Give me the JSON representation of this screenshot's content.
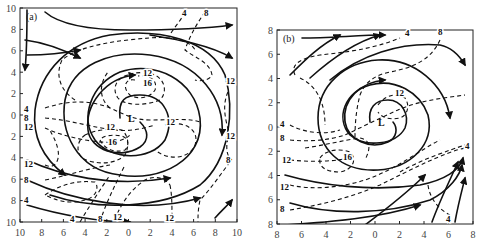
{
  "figure": {
    "panels": [
      {
        "id": "a",
        "label": "(a)",
        "frame": {
          "x": 20,
          "y": 8,
          "w": 217,
          "h": 214
        },
        "x_ticks": [
          "10",
          "8",
          "6",
          "4",
          "2",
          "0",
          "2",
          "4",
          "6",
          "8",
          "10"
        ],
        "y_ticks": [
          "10",
          "8",
          "6",
          "4",
          "2",
          "0",
          "2",
          "4",
          "6",
          "8",
          "10"
        ],
        "center_label": "L",
        "center": {
          "x": 125,
          "y": 118
        },
        "streamlines": [
          "M120,118 C118,100 125,95 140,95 C165,95 175,118 165,140 C150,162 110,160 95,140 C80,118 90,85 120,72 C155,60 195,80 200,118 C205,160 160,182 120,175 C75,170 60,130 65,100 C72,65 110,50 150,55 C200,62 225,100 222,135",
          "M140,122 C148,130 150,140 140,147 C120,160 90,150 88,130 C85,105 105,78 135,75",
          "M50,195 C95,210 160,210 200,185 C230,160 235,110 225,75 C210,40 160,28 110,35 C70,42 40,70 35,110 C32,140 45,160 65,175",
          "M27,180 C70,200 140,215 200,198",
          "M27,205 C60,215 100,222 130,222",
          "M27,160 C60,175 110,188 170,178",
          "M45,12 C60,25 90,30 130,30 C170,30 210,28 232,25",
          "M27,55 C50,55 70,52 80,50",
          "M27,10 C27,30 27,50 25,70",
          "M25,40 C40,42 60,48 80,58",
          "M150,35 C180,40 210,45 232,58",
          "M215,218 C222,210 228,205 232,200"
        ],
        "isotachs": [
          {
            "path": "M45,108 C70,100 90,100 110,108 C125,115 135,120 150,120 C170,120 190,118 200,122",
            "label": "4",
            "lx": 24,
            "ly": 112
          },
          {
            "path": "M45,118 C70,120 95,128 115,130 C130,132 145,128 155,125",
            "label": "8",
            "lx": 24,
            "ly": 121
          },
          {
            "path": "M45,128 C60,135 80,140 100,142 C115,143 125,140 130,135",
            "label": "12",
            "lx": 24,
            "ly": 130
          },
          {
            "path": "M135,80 C125,78 122,88 130,95 C138,100 150,98 155,90 C158,80 150,75 138,76",
            "label": "16",
            "lx": 143,
            "ly": 86
          },
          {
            "path": "M128,75 C115,78 112,90 118,98 C125,106 145,106 160,100 C168,92 165,78 152,74 C145,72 135,72 128,75",
            "label": "12",
            "lx": 143,
            "ly": 76
          },
          {
            "path": "M100,140 C105,150 115,153 125,150 C130,145 128,138 122,136 C112,134 102,136 100,140",
            "label": "16",
            "lx": 108,
            "ly": 145
          },
          {
            "path": "M85,135 C95,130 110,128 122,130 C128,135 130,145 125,155 C115,165 95,165 82,158 C75,150 78,140 85,135",
            "label": "12",
            "lx": 106,
            "ly": 130
          },
          {
            "path": "M165,125 C185,120 200,130 195,145 C190,158 170,162 155,150",
            "label": "12",
            "lx": 166,
            "ly": 125
          },
          {
            "path": "M228,92 C222,105 225,120 230,135",
            "label": "12",
            "lx": 226,
            "ly": 84
          },
          {
            "path": "M228,138 C225,150 228,158 232,160",
            "label": "12",
            "lx": 226,
            "ly": 139
          },
          {
            "path": "M185,12 C180,22 172,30 170,35",
            "label": "4",
            "lx": 182,
            "ly": 16
          },
          {
            "path": "M205,12 C198,22 190,35 185,50 C195,58 210,62 212,75 C210,80 200,82 195,80",
            "label": "8",
            "lx": 204,
            "ly": 16
          },
          {
            "path": "M230,162 C220,175 210,190 200,200 C198,210 198,215 198,222",
            "label": "8",
            "lx": 226,
            "ly": 163
          },
          {
            "path": "M170,185 C172,195 172,205 172,220",
            "label": "12",
            "lx": 165,
            "ly": 221
          },
          {
            "path": "M115,220 C120,205 130,190 145,180 C155,175 165,178 170,185",
            "label": "12",
            "lx": 113,
            "ly": 220
          },
          {
            "path": "M100,222 C105,205 115,185 125,165",
            "label": "8",
            "lx": 98,
            "ly": 222
          },
          {
            "path": "M80,222 C90,205 100,190 110,175",
            "label": "4",
            "lx": 70,
            "ly": 222
          },
          {
            "path": "M45,195 C60,185 75,180 95,182 C100,188 95,198 85,200 C70,205 55,200 45,195",
            "label": "4",
            "lx": 24,
            "ly": 203
          },
          {
            "path": "M45,180 C70,175 90,168 110,165",
            "label": "8",
            "lx": 24,
            "ly": 183
          },
          {
            "path": "M45,165 C55,170 60,160 58,150 C56,140 52,135 50,130",
            "label": "12",
            "lx": 24,
            "ly": 167
          },
          {
            "path": "M75,100 C60,90 55,75 62,60 C80,45 120,40 150,38 C170,36 190,40 195,50",
            "label": "",
            "lx": 0,
            "ly": 0
          },
          {
            "path": "M110,108 C100,100 98,85 108,72",
            "label": "",
            "lx": 0,
            "ly": 0
          }
        ]
      },
      {
        "id": "b",
        "label": "(b)",
        "frame": {
          "x": 277,
          "y": 30,
          "w": 196,
          "h": 194
        },
        "x_ticks": [
          "8",
          "6",
          "4",
          "2",
          "0",
          "2",
          "4",
          "6",
          "8"
        ],
        "y_ticks": [
          "8",
          "6",
          "4",
          "2",
          "0",
          "2",
          "4",
          "6",
          "8"
        ],
        "center_label": "L",
        "center": {
          "x": 375,
          "y": 122
        },
        "streamlines": [
          "M370,122 C368,108 375,100 388,100 C402,100 410,115 405,128 C396,145 365,148 350,135 C335,118 345,92 370,85 C395,78 420,92 428,115 C435,145 410,168 378,170 C340,172 318,148 318,118 C318,85 345,62 378,60 C415,58 445,85 450,118",
          "M393,122 C398,128 397,138 388,142 C370,150 348,140 345,122 C342,100 360,82 385,80",
          "M285,175 C320,185 370,192 420,185 C445,180 460,170 463,158",
          "M290,203 C330,215 385,215 430,200 C450,190 460,175 462,165",
          "M285,225 C330,222 380,218 420,205",
          "M302,38 C330,38 360,35 385,35",
          "M290,75 C305,60 320,45 340,35",
          "M310,78 C330,60 355,42 380,35",
          "M365,225 C385,210 405,195 425,175",
          "M432,222 C440,200 450,180 458,162",
          "M455,222 C458,205 462,190 465,178",
          "M330,80 C360,55 400,42 440,45 C455,48 462,60 465,65"
        ],
        "isotachs": [
          {
            "path": "M378,105 C385,95 398,92 405,98 C410,105 408,115 400,118 C390,120 382,118 378,112",
            "label": "12",
            "lx": 395,
            "ly": 96
          },
          {
            "path": "M320,158 C325,150 340,148 350,152 C358,160 352,170 340,172 C328,172 318,168 320,158",
            "label": "16",
            "lx": 343,
            "ly": 160
          },
          {
            "path": "M305,148 C325,145 345,140 360,138 C372,140 370,150 365,160",
            "label": "",
            "lx": 0,
            "ly": 0
          },
          {
            "path": "M290,160 C310,162 330,162 350,158",
            "label": "12",
            "lx": 282,
            "ly": 163
          },
          {
            "path": "M290,185 C310,190 340,188 365,180 C395,170 420,150 440,140",
            "label": "12",
            "lx": 280,
            "ly": 190
          },
          {
            "path": "M290,210 C320,205 350,198 380,185 C410,170 445,152 465,148",
            "label": "8",
            "lx": 280,
            "ly": 212
          },
          {
            "path": "M290,140 C310,142 330,140 345,135 C360,128 380,118 398,110 C420,100 445,98 465,95",
            "label": "8",
            "lx": 280,
            "ly": 141
          },
          {
            "path": "M290,125 C305,133 325,135 340,130",
            "label": "4",
            "lx": 280,
            "ly": 127
          },
          {
            "path": "M400,172 C420,160 450,150 465,145",
            "label": "4",
            "lx": 465,
            "ly": 149
          },
          {
            "path": "M428,185 C430,200 440,210 450,215",
            "label": "4",
            "lx": 446,
            "ly": 222
          },
          {
            "path": "M355,137 C355,125 356,110 360,95 C365,82 375,75 390,72 C410,68 430,62 440,40",
            "label": "8",
            "lx": 438,
            "ly": 35
          },
          {
            "path": "M295,75 C290,65 300,58 320,55 C345,52 370,50 400,38",
            "label": "4",
            "lx": 405,
            "ly": 36
          },
          {
            "path": "M300,78 C315,85 325,100 325,125",
            "label": "",
            "lx": 0,
            "ly": 0
          }
        ]
      }
    ]
  },
  "chart_data": [
    {
      "type": "diagram",
      "title": "(a)",
      "description": "Streamlines (solid, with arrows) and isotachs (dashed) spiraling around a low-pressure center L",
      "x_tick_labels": [
        "10",
        "8",
        "6",
        "4",
        "2",
        "0",
        "2",
        "4",
        "6",
        "8",
        "10"
      ],
      "y_tick_labels": [
        "10",
        "8",
        "6",
        "4",
        "2",
        "0",
        "2",
        "4",
        "6",
        "8",
        "10"
      ],
      "isotach_labels": [
        "4",
        "8",
        "12",
        "16"
      ],
      "center": "L",
      "max_isotach": 16
    },
    {
      "type": "diagram",
      "title": "(b)",
      "description": "Streamlines (solid, with arrows) and isotachs (dashed) spiraling around a low-pressure center L",
      "x_tick_labels": [
        "8",
        "6",
        "4",
        "2",
        "0",
        "2",
        "4",
        "6",
        "8"
      ],
      "y_tick_labels": [
        "8",
        "6",
        "4",
        "2",
        "0",
        "2",
        "4",
        "6",
        "8"
      ],
      "isotach_labels": [
        "4",
        "8",
        "12",
        "16"
      ],
      "center": "L",
      "max_isotach": 16
    }
  ]
}
